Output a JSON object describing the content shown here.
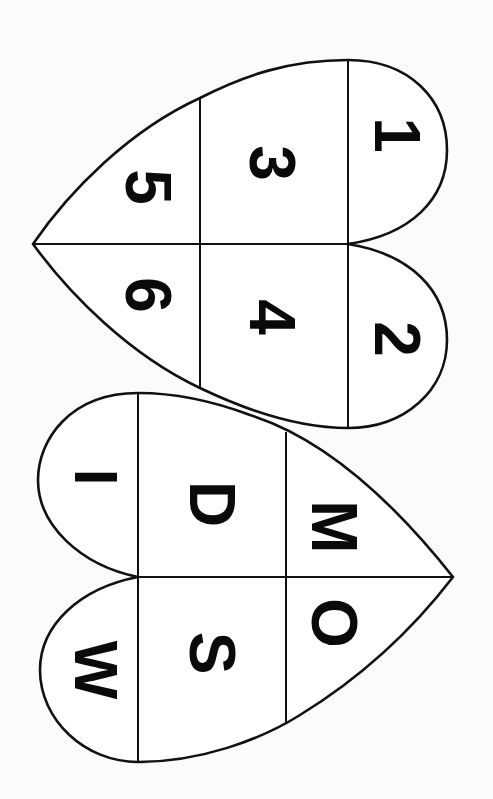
{
  "worksheet": {
    "colors": {
      "background": "#fbfbfb",
      "ink": "#111111",
      "fill": "#ffffff"
    },
    "top_heart": {
      "cells": [
        {
          "label": "1",
          "x": 397,
          "y": 135
        },
        {
          "label": "2",
          "x": 397,
          "y": 339
        },
        {
          "label": "3",
          "x": 272,
          "y": 163
        },
        {
          "label": "4",
          "x": 272,
          "y": 317
        },
        {
          "label": "5",
          "x": 148,
          "y": 187
        },
        {
          "label": "6",
          "x": 148,
          "y": 295
        }
      ]
    },
    "bottom_heart": {
      "cells": [
        {
          "label": "W",
          "x": 96,
          "y": 670
        },
        {
          "label": "I",
          "x": 96,
          "y": 477
        },
        {
          "label": "S",
          "x": 212,
          "y": 653
        },
        {
          "label": "D",
          "x": 212,
          "y": 504
        },
        {
          "label": "O",
          "x": 334,
          "y": 623
        },
        {
          "label": "M",
          "x": 334,
          "y": 527
        }
      ]
    }
  }
}
